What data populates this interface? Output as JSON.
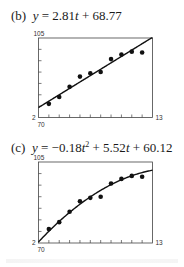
{
  "figures": [
    {
      "id": "b",
      "label": "(b)",
      "equation_parts": {
        "lhs": "y",
        "eq": " = ",
        "rhs_a": "2.81",
        "var": "t",
        "rhs_b": " + 68.77"
      },
      "equation_text": "(b)  y = 2.81t + 68.77"
    },
    {
      "id": "c",
      "label": "(c)",
      "equation_parts": {
        "lhs": "y",
        "eq": " = ",
        "c2": "−0.18",
        "var": "t",
        "exp": "2",
        "c1": " + 5.52",
        "var2": "t",
        "c0": " + 60.12"
      },
      "equation_text": "(c)  y = −0.18t² + 5.52t + 60.12"
    }
  ],
  "chart_data": [
    {
      "type": "scatter",
      "title": "(b) y = 2.81t + 68.77",
      "xlabel": "",
      "ylabel": "",
      "xlim": [
        2,
        13
      ],
      "ylim": [
        70,
        105
      ],
      "x_tick_labels": {
        "min": "2",
        "max": "13"
      },
      "y_tick_labels": {
        "min": "70",
        "max": "105"
      },
      "x_ticks_step": 1,
      "y_ticks_step": 5,
      "grid": false,
      "series": [
        {
          "name": "data",
          "kind": "points",
          "x": [
            3,
            4,
            5,
            6,
            7,
            8,
            9,
            10,
            11,
            12
          ],
          "y": [
            76.0,
            79.0,
            83.5,
            88.0,
            89.5,
            90.0,
            95.7,
            97.7,
            99.0,
            98.6
          ]
        },
        {
          "name": "linear model",
          "kind": "line",
          "equation": "y = 2.81t + 68.77",
          "coefficients": {
            "a": 2.81,
            "b": 68.77
          }
        }
      ]
    },
    {
      "type": "scatter",
      "title": "(c) y = -0.18t^2 + 5.52t + 60.12",
      "xlabel": "",
      "ylabel": "",
      "xlim": [
        2,
        13
      ],
      "ylim": [
        70,
        105
      ],
      "x_tick_labels": {
        "min": "2",
        "max": "13"
      },
      "y_tick_labels": {
        "min": "70",
        "max": "105"
      },
      "x_ticks_step": 1,
      "y_ticks_step": 5,
      "grid": false,
      "series": [
        {
          "name": "data",
          "kind": "points",
          "x": [
            3,
            4,
            5,
            6,
            7,
            8,
            9,
            10,
            11,
            12
          ],
          "y": [
            76.0,
            79.0,
            83.5,
            88.0,
            89.5,
            90.0,
            95.7,
            97.7,
            99.0,
            98.6
          ]
        },
        {
          "name": "quadratic model",
          "kind": "curve",
          "equation": "y = -0.18t^2 + 5.52t + 60.12",
          "coefficients": {
            "a": -0.18,
            "b": 5.52,
            "c": 60.12
          }
        }
      ]
    }
  ]
}
